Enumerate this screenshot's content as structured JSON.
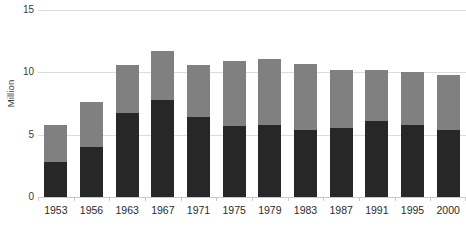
{
  "chart_data": {
    "type": "bar",
    "title": "",
    "subtitle": "",
    "xlabel": "",
    "ylabel": "Million",
    "stacked": true,
    "grid": true,
    "legend": "none",
    "ylim": [
      0,
      15
    ],
    "yticks": [
      0,
      5,
      10,
      15
    ],
    "ytick_labels": [
      "0",
      "5",
      "10",
      "15"
    ],
    "categories": [
      "1953",
      "1956",
      "1963",
      "1967",
      "1971",
      "1975",
      "1979",
      "1983",
      "1987",
      "1991",
      "1995",
      "2000"
    ],
    "series": [
      {
        "name": "lower-segment",
        "color": "#272727",
        "values": [
          2.8,
          4.0,
          6.7,
          7.8,
          6.4,
          5.7,
          5.8,
          5.4,
          5.5,
          6.1,
          5.8,
          5.4
        ]
      },
      {
        "name": "upper-segment",
        "color": "#808080",
        "values": [
          3.0,
          3.6,
          3.9,
          3.9,
          4.2,
          5.2,
          5.3,
          5.3,
          4.7,
          4.1,
          4.2,
          4.4
        ]
      }
    ],
    "totals": [
      5.8,
      7.6,
      10.6,
      11.7,
      10.6,
      10.9,
      11.1,
      10.7,
      10.2,
      10.2,
      10.0,
      9.8
    ]
  },
  "colors": {
    "lower": "#272727",
    "upper": "#808080",
    "gridline": "#dcdcdc",
    "axis": "#c9c9c9",
    "text": "#2b2b2b",
    "background": "#ffffff"
  }
}
